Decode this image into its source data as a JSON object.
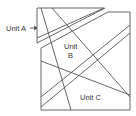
{
  "diagram": {
    "type": "geologic-cross-section",
    "labels": {
      "unit_a": "Unit A",
      "unit_b_line1": "Unit",
      "unit_b_line2": "B",
      "unit_c": "Unit C"
    },
    "colors": {
      "line": "#555555",
      "text": "#333333",
      "background": "#ffffff"
    }
  }
}
